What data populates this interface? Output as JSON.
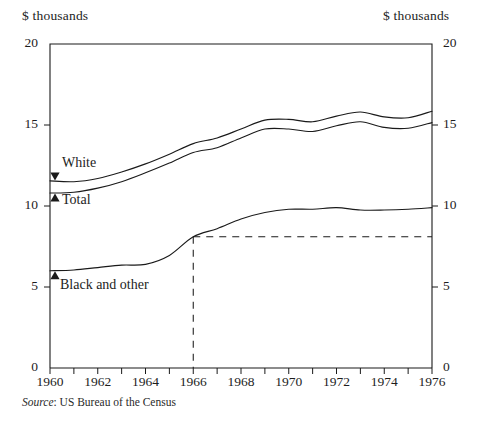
{
  "figure": {
    "left_axis_unit": "$ thousands",
    "right_axis_unit": "$ thousands",
    "source_prefix": "Source",
    "source_separator": ":",
    "source_text": "US Bureau of the Census",
    "line_color": "#1a1a1a",
    "axis_color": "#1a1a1a",
    "background": "#ffffff"
  },
  "labels": {
    "white": "White",
    "total": "Total",
    "black_and_other": "Black and other"
  },
  "chart_data": {
    "type": "line",
    "title": "",
    "subtitle": "",
    "xlabel": "",
    "ylabel": "$ thousands",
    "y2label": "$ thousands",
    "xlim": [
      1960,
      1976
    ],
    "ylim": [
      0,
      20
    ],
    "grid": false,
    "legend": "inline-labels",
    "yticks": [
      0,
      5,
      10,
      15,
      20
    ],
    "ytick_labels": [
      "0",
      "5",
      "10",
      "15",
      "20"
    ],
    "xticks": [
      1960,
      1961,
      1962,
      1963,
      1964,
      1965,
      1966,
      1967,
      1968,
      1969,
      1970,
      1971,
      1972,
      1973,
      1974,
      1975,
      1976
    ],
    "xtick_labels_shown": [
      "1960",
      "1962",
      "1964",
      "1966",
      "1968",
      "1970",
      "1972",
      "1974",
      "1976"
    ],
    "x": [
      1960,
      1961,
      1962,
      1963,
      1964,
      1965,
      1966,
      1967,
      1968,
      1969,
      1970,
      1971,
      1972,
      1973,
      1974,
      1975,
      1976
    ],
    "series": [
      {
        "name": "White",
        "values": [
          11.55,
          11.5,
          11.7,
          12.1,
          12.6,
          13.2,
          13.85,
          14.2,
          14.75,
          15.3,
          15.35,
          15.2,
          15.55,
          15.8,
          15.5,
          15.45,
          15.85
        ]
      },
      {
        "name": "Total",
        "values": [
          10.8,
          10.85,
          11.1,
          11.5,
          12.05,
          12.65,
          13.3,
          13.6,
          14.2,
          14.75,
          14.75,
          14.6,
          14.95,
          15.2,
          14.85,
          14.8,
          15.15
        ]
      },
      {
        "name": "Black and other",
        "values": [
          6.0,
          6.05,
          6.2,
          6.35,
          6.4,
          6.95,
          8.1,
          8.6,
          9.2,
          9.6,
          9.8,
          9.8,
          9.9,
          9.75,
          9.75,
          9.8,
          9.9
        ]
      }
    ],
    "annotations": [
      {
        "name": "reference-lines",
        "style": "dashed",
        "x_value": 1966,
        "y_value": 8.1,
        "description": "dashed vertical line at 1966 and dashed horizontal line at 8.1 extending to right axis"
      }
    ],
    "series_marker_labels": [
      {
        "name": "White",
        "marker": "down-triangle"
      },
      {
        "name": "Total",
        "marker": "up-triangle"
      },
      {
        "name": "Black and other",
        "marker": "up-triangle"
      }
    ]
  }
}
